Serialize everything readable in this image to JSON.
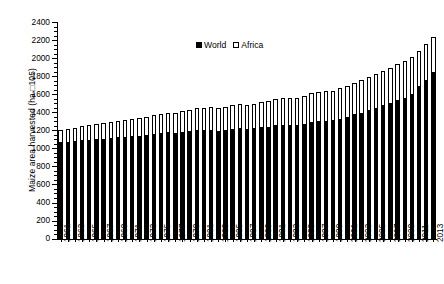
{
  "chart_data": {
    "type": "bar",
    "stacked": true,
    "title": "",
    "xlabel": "",
    "ylabel": "Maize area harvested (ha □105)",
    "ylim": [
      0,
      2400
    ],
    "ytick_step": 200,
    "yticks": [
      0,
      200,
      400,
      600,
      800,
      1000,
      1200,
      1400,
      1600,
      1800,
      2000,
      2200,
      2400
    ],
    "ytick_labels": [
      "0",
      "200",
      "400",
      "600",
      "800",
      "1000",
      "1200",
      "1400",
      "1600",
      "1800",
      "2000",
      "2200",
      "2400"
    ],
    "grid": false,
    "legend_position": "top-center",
    "legend": [
      "World",
      "Africa"
    ],
    "categories": [
      "1961",
      "1962",
      "1963",
      "1964",
      "1965",
      "1966",
      "1967",
      "1968",
      "1969",
      "1970",
      "1971",
      "1972",
      "1973",
      "1974",
      "1975",
      "1976",
      "1977",
      "1978",
      "1979",
      "1980",
      "1981",
      "1982",
      "1983",
      "1984",
      "1985",
      "1986",
      "1987",
      "1988",
      "1989",
      "1990",
      "1991",
      "1992",
      "1993",
      "1994",
      "1995",
      "1996",
      "1997",
      "1998",
      "1999",
      "2000",
      "2001",
      "2002",
      "2003",
      "2004",
      "2005",
      "2006",
      "2007",
      "2008",
      "2009",
      "2010",
      "2011",
      "2012",
      "2013"
    ],
    "xtick_labels_shown": [
      "1961",
      "1963",
      "1965",
      "1967",
      "1969",
      "1971",
      "1973",
      "1975",
      "1977",
      "1979",
      "1981",
      "1983",
      "1985",
      "1987",
      "1989",
      "1991",
      "1993",
      "1995",
      "1997",
      "1999",
      "2001",
      "2003",
      "2005",
      "2007",
      "2009",
      "2011",
      "2013"
    ],
    "series": [
      {
        "name": "World",
        "color": "#000000",
        "values": [
          1060,
          1060,
          1070,
          1085,
          1090,
          1095,
          1100,
          1110,
          1115,
          1120,
          1125,
          1130,
          1140,
          1150,
          1160,
          1170,
          1165,
          1175,
          1185,
          1200,
          1195,
          1200,
          1185,
          1200,
          1210,
          1215,
          1210,
          1215,
          1225,
          1230,
          1250,
          1255,
          1250,
          1255,
          1265,
          1290,
          1295,
          1300,
          1305,
          1320,
          1345,
          1370,
          1390,
          1420,
          1445,
          1470,
          1495,
          1530,
          1555,
          1600,
          1680,
          1755,
          1840
        ]
      },
      {
        "name": "Africa",
        "color": "#ffffff",
        "values": [
          150,
          160,
          165,
          170,
          175,
          180,
          185,
          190,
          195,
          200,
          205,
          210,
          215,
          220,
          225,
          230,
          235,
          240,
          245,
          250,
          255,
          258,
          262,
          268,
          272,
          276,
          280,
          285,
          290,
          295,
          300,
          305,
          310,
          312,
          318,
          325,
          330,
          335,
          340,
          348,
          355,
          362,
          370,
          378,
          385,
          392,
          400,
          408,
          415,
          422,
          400,
          410,
          400
        ]
      }
    ],
    "totals": [
      1210,
      1220,
      1235,
      1255,
      1265,
      1275,
      1285,
      1300,
      1310,
      1320,
      1330,
      1340,
      1355,
      1370,
      1385,
      1400,
      1400,
      1415,
      1430,
      1450,
      1450,
      1458,
      1447,
      1468,
      1482,
      1491,
      1490,
      1500,
      1515,
      1525,
      1550,
      1560,
      1560,
      1567,
      1583,
      1615,
      1625,
      1635,
      1645,
      1668,
      1700,
      1732,
      1760,
      1798,
      1830,
      1862,
      1895,
      1938,
      1970,
      2022,
      2080,
      2165,
      2240
    ]
  }
}
